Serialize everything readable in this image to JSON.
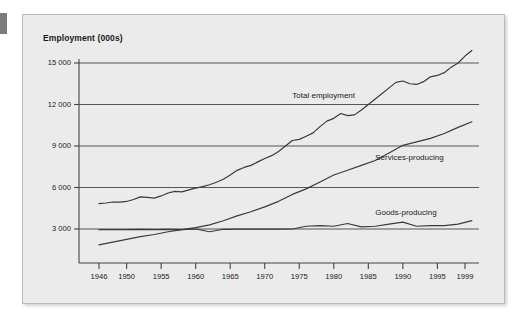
{
  "figure": {
    "title": "Employment (000s)"
  },
  "chart_data": {
    "type": "line",
    "title": "Employment (000s)",
    "xlabel": "",
    "ylabel": "Employment (000s)",
    "xlim": [
      1946,
      2000
    ],
    "ylim": [
      0,
      16000
    ],
    "yticks": [
      3000,
      6000,
      9000,
      12000,
      15000
    ],
    "ytick_labels": [
      "3 000",
      "6 000",
      "9 000",
      "12 000",
      "15 000"
    ],
    "xticks": [
      1946,
      1950,
      1955,
      1960,
      1965,
      1970,
      1975,
      1980,
      1985,
      1990,
      1995,
      1999
    ],
    "xtick_labels": [
      "1946",
      "1950",
      "1955",
      "1960",
      "1965",
      "1970",
      "1975",
      "1980",
      "1985",
      "1990",
      "1995",
      "1999"
    ],
    "grid": "horizontal",
    "legend_position": "inline-annotations",
    "line_color": "#3a3a3a",
    "series": [
      {
        "name": "Total employment",
        "label_x": 1974,
        "label_y": 12600,
        "x": [
          1946,
          1947,
          1948,
          1949,
          1950,
          1951,
          1952,
          1953,
          1954,
          1955,
          1956,
          1957,
          1958,
          1959,
          1960,
          1961,
          1962,
          1963,
          1964,
          1965,
          1966,
          1967,
          1968,
          1969,
          1970,
          1971,
          1972,
          1973,
          1974,
          1975,
          1976,
          1977,
          1978,
          1979,
          1980,
          1981,
          1982,
          1983,
          1984,
          1985,
          1986,
          1987,
          1988,
          1989,
          1990,
          1991,
          1992,
          1993,
          1994,
          1995,
          1996,
          1997,
          1998,
          1999,
          2000
        ],
        "values": [
          4829,
          4880,
          4950,
          4940,
          4990,
          5130,
          5320,
          5290,
          5230,
          5390,
          5600,
          5720,
          5680,
          5830,
          5960,
          6060,
          6200,
          6380,
          6600,
          6900,
          7240,
          7450,
          7600,
          7850,
          8100,
          8300,
          8600,
          9000,
          9400,
          9480,
          9700,
          9950,
          10400,
          10800,
          11000,
          11350,
          11200,
          11250,
          11600,
          12000,
          12400,
          12800,
          13200,
          13600,
          13700,
          13500,
          13450,
          13650,
          14000,
          14100,
          14300,
          14700,
          15000,
          15500,
          15900
        ],
        "values_note": "read from chart, thousands"
      },
      {
        "name": "Services-producing",
        "label_x": 1986,
        "label_y": 8100,
        "x": [
          1946,
          1948,
          1950,
          1952,
          1954,
          1956,
          1958,
          1960,
          1962,
          1964,
          1966,
          1968,
          1970,
          1972,
          1974,
          1976,
          1978,
          1980,
          1982,
          1984,
          1986,
          1988,
          1990,
          1992,
          1994,
          1996,
          1998,
          2000
        ],
        "values": [
          1850,
          2050,
          2250,
          2450,
          2600,
          2800,
          2950,
          3100,
          3300,
          3600,
          3950,
          4250,
          4600,
          5000,
          5500,
          5900,
          6400,
          6900,
          7250,
          7600,
          7950,
          8500,
          9050,
          9300,
          9550,
          9900,
          10350,
          10750
        ]
      },
      {
        "name": "Goods-producing",
        "label_x": 1986,
        "label_y": 4150,
        "x": [
          1946,
          1948,
          1950,
          1952,
          1954,
          1956,
          1958,
          1960,
          1962,
          1964,
          1966,
          1968,
          1970,
          1972,
          1974,
          1976,
          1978,
          1980,
          1982,
          1984,
          1986,
          1988,
          1990,
          1992,
          1994,
          1996,
          1998,
          2000
        ],
        "values": [
          2950,
          2960,
          2950,
          2980,
          2960,
          2980,
          2960,
          3000,
          2800,
          2980,
          2990,
          2990,
          2990,
          2990,
          3000,
          3200,
          3250,
          3200,
          3400,
          3150,
          3200,
          3350,
          3500,
          3200,
          3250,
          3250,
          3350,
          3600
        ]
      }
    ]
  }
}
